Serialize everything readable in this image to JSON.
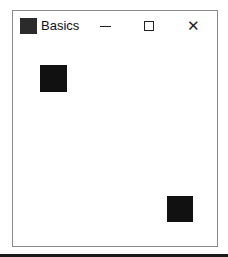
{
  "window": {
    "title": "Basics",
    "controls": {
      "minimize": "—",
      "maximize": "☐",
      "close": "✕"
    }
  },
  "client": {
    "squares": [
      {
        "name": "square-top-left",
        "x": 27,
        "y": 24,
        "size": 27,
        "color": "#111111"
      },
      {
        "name": "square-bottom-right",
        "x": 154,
        "y": 155,
        "size": 26,
        "color": "#111111"
      }
    ]
  },
  "colors": {
    "background": "#ffffff",
    "border": "#8a8a8a",
    "square": "#111111",
    "icon": "#2b2b2b"
  }
}
